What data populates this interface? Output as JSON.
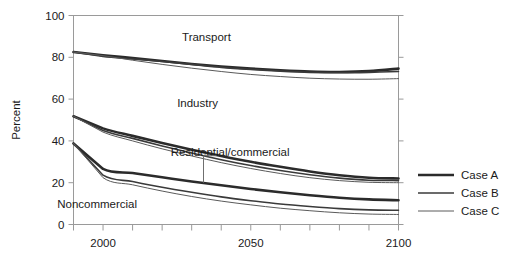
{
  "chart_data": {
    "type": "line",
    "title": "",
    "xlabel": "",
    "ylabel": "Percent",
    "xlim": [
      1990,
      2100
    ],
    "ylim": [
      0,
      100
    ],
    "grid": false,
    "x_ticks": [
      1990,
      2000,
      2010,
      2020,
      2030,
      2040,
      2050,
      2060,
      2070,
      2080,
      2090,
      2100
    ],
    "x_tick_labels": [
      "",
      "2000",
      "",
      "",
      "",
      "",
      "2050",
      "",
      "",
      "",
      "",
      "2100"
    ],
    "y_ticks": [
      0,
      20,
      40,
      60,
      80,
      100
    ],
    "y_tick_labels": [
      "0",
      "20",
      "40",
      "60",
      "80",
      "100"
    ],
    "legend_position": "right",
    "annotations": [
      {
        "text": "Transport",
        "x": 2035,
        "y": 88
      },
      {
        "text": "Industry",
        "x": 2032,
        "y": 56
      },
      {
        "text": "Residential/commercial",
        "x": 2043,
        "y": 33
      },
      {
        "text": "Noncommercial",
        "x": 1998,
        "y": 8
      }
    ],
    "x": [
      1990,
      2000,
      2010,
      2020,
      2030,
      2040,
      2050,
      2060,
      2070,
      2080,
      2090,
      2100
    ],
    "groups": [
      {
        "name": "Transport",
        "series": [
          {
            "name": "Case A",
            "values": [
              82.5,
              81.0,
              79.6,
              78.2,
              76.8,
              75.6,
              74.6,
              73.8,
              73.2,
              73.0,
              73.4,
              74.6
            ]
          },
          {
            "name": "Case B",
            "values": [
              82.5,
              80.4,
              79.2,
              78.0,
              76.6,
              75.2,
              74.2,
              73.4,
              72.8,
              72.6,
              72.8,
              73.2
            ]
          },
          {
            "name": "Case C",
            "values": [
              82.5,
              80.8,
              78.6,
              76.6,
              74.8,
              73.2,
              71.8,
              70.8,
              70.0,
              69.6,
              69.5,
              69.8
            ]
          }
        ]
      },
      {
        "name": "Industry",
        "series": [
          {
            "name": "Case A",
            "values": [
              51.8,
              46.0,
              42.4,
              39.0,
              35.8,
              32.8,
              30.0,
              27.6,
              25.4,
              23.6,
              22.4,
              22.0
            ]
          },
          {
            "name": "Case B",
            "values": [
              51.8,
              45.0,
              41.2,
              37.6,
              34.2,
              31.0,
              28.2,
              25.8,
              23.8,
              22.2,
              21.2,
              21.0
            ]
          },
          {
            "name": "Case C",
            "values": [
              51.8,
              44.2,
              40.0,
              36.2,
              32.8,
              29.6,
              26.8,
              24.4,
              22.4,
              21.0,
              20.2,
              20.0
            ]
          }
        ]
      },
      {
        "name": "Residential/commercial",
        "series": [
          {
            "name": "Case A",
            "values": [
              38.8,
              26.6,
              24.6,
              22.6,
              20.6,
              18.8,
              17.0,
              15.4,
              14.0,
              12.8,
              12.0,
              11.6
            ]
          },
          {
            "name": "Case B",
            "values": [
              38.8,
              23.6,
              20.6,
              17.8,
              15.4,
              13.2,
              11.4,
              9.8,
              8.6,
              7.6,
              7.0,
              6.8
            ]
          },
          {
            "name": "Case C",
            "values": [
              38.8,
              22.4,
              19.0,
              16.0,
              13.4,
              11.2,
              9.4,
              7.8,
              6.6,
              5.6,
              5.0,
              4.8
            ]
          }
        ]
      }
    ],
    "legend": [
      {
        "label": "Case A",
        "width": 2.6,
        "color": "#2b2b2b"
      },
      {
        "label": "Case B",
        "width": 1.6,
        "color": "#3a3a3a"
      },
      {
        "label": "Case C",
        "width": 1.0,
        "color": "#5a5a5a"
      }
    ]
  }
}
